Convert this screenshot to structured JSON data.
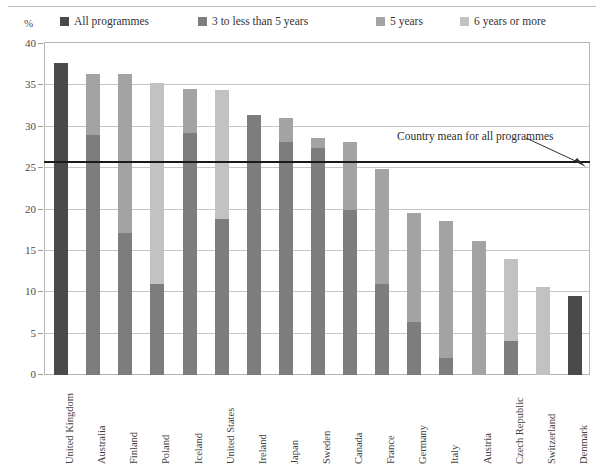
{
  "axis": {
    "y_unit_label": "%",
    "y_ticks": [
      "0",
      "5",
      "10",
      "15",
      "20",
      "25",
      "30",
      "35",
      "40"
    ],
    "y_min": 0,
    "y_max": 40
  },
  "legend": {
    "items": [
      {
        "label": "All programmes",
        "color": "#4a4a4a"
      },
      {
        "label": "3 to less than 5 years",
        "color": "#7d7d7d"
      },
      {
        "label": "5 years",
        "color": "#a3a3a3"
      },
      {
        "label": "6 years or more",
        "color": "#c2c2c2"
      }
    ]
  },
  "annotation": {
    "mean_note": "Country mean for all programmes",
    "mean_value": 25.6
  },
  "chart_data": {
    "type": "bar",
    "title": "",
    "subtitle": "",
    "xlabel": "",
    "ylabel": "%",
    "ylim": [
      0,
      40
    ],
    "ytick_step": 5,
    "grid": true,
    "stacked": true,
    "legend_position": "top",
    "categories": [
      "United Kingdom",
      "Australia",
      "Finland",
      "Poland",
      "Iceland",
      "United States",
      "Ireland",
      "Japan",
      "Sweden",
      "Canada",
      "France",
      "Germany",
      "Italy",
      "Austria",
      "Czech Republic",
      "Switzerland",
      "Denmark"
    ],
    "series": [
      {
        "name": "All programmes",
        "color": "#4a4a4a",
        "values": [
          37.7,
          0,
          0,
          0,
          0,
          0,
          0,
          0,
          0,
          0,
          0,
          0,
          0,
          0,
          0,
          0,
          9.6
        ]
      },
      {
        "name": "3 to less than 5 years",
        "color": "#7d7d7d",
        "values": [
          0,
          29.0,
          17.2,
          11.0,
          29.3,
          18.9,
          31.4,
          28.1,
          27.4,
          19.9,
          11.0,
          6.4,
          2.0,
          0,
          4.1,
          0,
          0
        ]
      },
      {
        "name": "5 years",
        "color": "#a3a3a3",
        "values": [
          0,
          7.4,
          19.2,
          0,
          5.3,
          0,
          0,
          3.0,
          1.3,
          8.2,
          13.9,
          13.2,
          16.6,
          16.2,
          0,
          0,
          0
        ]
      },
      {
        "name": "6 years or more",
        "color": "#c2c2c2",
        "values": [
          0,
          0,
          0,
          24.3,
          0,
          15.6,
          0,
          0,
          0,
          0,
          0,
          0,
          0,
          0,
          9.9,
          10.6,
          0
        ]
      }
    ],
    "totals": [
      37.7,
      36.4,
      36.4,
      35.3,
      34.6,
      34.5,
      31.4,
      31.1,
      28.7,
      28.1,
      24.9,
      19.6,
      18.6,
      16.2,
      14.0,
      10.6,
      9.6
    ],
    "country_mean_line": 25.6
  },
  "colors": {
    "all_programmes": "#4a4a4a",
    "three_to_five": "#7d7d7d",
    "five_years": "#a3a3a3",
    "six_plus": "#c2c2c2",
    "grid": "#c6c6c6",
    "axis": "#b5b5b5",
    "mean_line": "#1a1a1a"
  }
}
